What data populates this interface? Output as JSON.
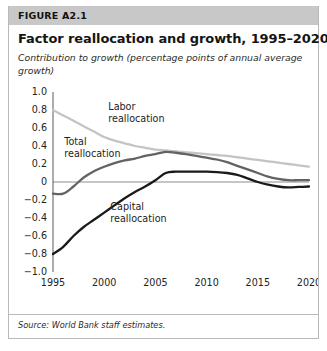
{
  "figure": {
    "number": "FIGURE A2.1",
    "title": "Factor reallocation and growth, 1995–2020",
    "subtitle": "Contribution to growth (percentage points of annual average growth)",
    "source": "Source: World Bank staff estimates."
  },
  "colors": {
    "band": "#c8c8c8",
    "border": "#b9b9b9",
    "labor": "#c4c4c4",
    "total": "#636363",
    "capital": "#1a1a1a",
    "axis": "#5a5a5a",
    "zero_line": "#8c8c8c",
    "text": "#232323"
  },
  "chart_data": {
    "type": "line",
    "title": "Factor reallocation and growth, 1995–2020",
    "subtitle": "Contribution to growth (percentage points of annual average growth)",
    "xlabel": "",
    "ylabel": "",
    "xlim": [
      1995,
      2020
    ],
    "ylim": [
      -1.0,
      1.0
    ],
    "grid": false,
    "legend_position": "inline-annotations",
    "xticks": [
      1995,
      2000,
      2005,
      2010,
      2015,
      2020
    ],
    "xtick_labels": [
      "1995",
      "2000",
      "2005",
      "2010",
      "2015",
      "2020"
    ],
    "yticks": [
      1.0,
      0.8,
      0.6,
      0.4,
      0.2,
      0,
      -0.2,
      -0.4,
      -0.6,
      -0.8,
      -1.0
    ],
    "ytick_labels": [
      "1.0",
      "0.8",
      "0.6",
      "0.4",
      "0.2",
      "0",
      "−0.2",
      "−0.4",
      "−0.6",
      "−0.8",
      "−1.0"
    ],
    "zero_line": 0,
    "x": [
      1995,
      1996,
      1997,
      1998,
      1999,
      2000,
      2001,
      2002,
      2003,
      2004,
      2005,
      2006,
      2007,
      2008,
      2009,
      2010,
      2011,
      2012,
      2013,
      2014,
      2015,
      2016,
      2017,
      2018,
      2019,
      2020
    ],
    "series": [
      {
        "name": "Labor reallocation",
        "color": "#c4c4c4",
        "label_x": 2000.4,
        "label_y": 0.8,
        "values": [
          0.8,
          0.74,
          0.68,
          0.62,
          0.56,
          0.5,
          0.46,
          0.43,
          0.4,
          0.38,
          0.36,
          0.35,
          0.34,
          0.33,
          0.32,
          0.31,
          0.3,
          0.29,
          0.275,
          0.26,
          0.245,
          0.23,
          0.215,
          0.2,
          0.185,
          0.17
        ]
      },
      {
        "name": "Total reallocation",
        "color": "#636363",
        "label_x": 1996.1,
        "label_y": 0.41,
        "values": [
          -0.13,
          -0.13,
          -0.05,
          0.05,
          0.12,
          0.17,
          0.21,
          0.24,
          0.26,
          0.29,
          0.31,
          0.335,
          0.325,
          0.31,
          0.29,
          0.27,
          0.25,
          0.22,
          0.18,
          0.14,
          0.1,
          0.06,
          0.035,
          0.02,
          0.02,
          0.02
        ]
      },
      {
        "name": "Capital reallocation",
        "color": "#1a1a1a",
        "label_x": 2000.6,
        "label_y": -0.31,
        "values": [
          -0.8,
          -0.72,
          -0.6,
          -0.5,
          -0.42,
          -0.34,
          -0.26,
          -0.18,
          -0.11,
          -0.05,
          0.02,
          0.1,
          0.115,
          0.115,
          0.115,
          0.115,
          0.11,
          0.1,
          0.08,
          0.04,
          0.0,
          -0.03,
          -0.05,
          -0.06,
          -0.055,
          -0.05
        ]
      }
    ]
  }
}
